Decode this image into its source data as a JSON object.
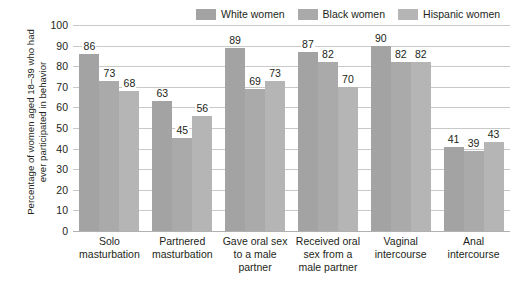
{
  "chart_data": {
    "type": "bar",
    "title": "",
    "xlabel": "",
    "ylabel": "Percentage of women aged 18–39 who had ever participated in behavior",
    "ylim": [
      0,
      100
    ],
    "ytick_values": [
      100,
      90,
      80,
      70,
      60,
      50,
      40,
      30,
      20,
      10,
      0
    ],
    "ytick_labels": [
      "100",
      "90",
      "80",
      "70",
      "60",
      "50",
      "40",
      "30",
      "20",
      "10",
      "0"
    ],
    "grid": true,
    "legend_position": "top-right",
    "categories": [
      "Solo masturbation",
      "Partnered masturbation",
      "Gave oral sex to a male partner",
      "Received oral sex from a male partner",
      "Vaginal intercourse",
      "Anal intercourse"
    ],
    "category_lines": [
      [
        "Solo",
        "masturbation"
      ],
      [
        "Partnered",
        "masturbation"
      ],
      [
        "Gave oral sex",
        "to a male",
        "partner"
      ],
      [
        "Received oral",
        "sex from a",
        "male partner"
      ],
      [
        "Vaginal",
        "intercourse"
      ],
      [
        "Anal",
        "intercourse"
      ]
    ],
    "series": [
      {
        "name": "White women",
        "color": "#a3a3a3",
        "values": [
          86,
          63,
          89,
          87,
          90,
          41
        ],
        "labels": [
          "86",
          "63",
          "89",
          "87",
          "90",
          "41"
        ]
      },
      {
        "name": "Black women",
        "color": "#aaaaaa",
        "values": [
          73,
          45,
          69,
          82,
          82,
          39
        ],
        "labels": [
          "73",
          "45",
          "69",
          "82",
          "82",
          "39"
        ]
      },
      {
        "name": "Hispanic women",
        "color": "#b5b5b5",
        "values": [
          68,
          56,
          73,
          70,
          82,
          43
        ],
        "labels": [
          "68",
          "56",
          "73",
          "70",
          "82",
          "43"
        ]
      }
    ]
  },
  "legend": {
    "items": [
      {
        "label": "White women",
        "color": "#a3a3a3"
      },
      {
        "label": "Black women",
        "color": "#aaaaaa"
      },
      {
        "label": "Hispanic women",
        "color": "#b5b5b5"
      }
    ]
  },
  "axis": {
    "y_title": "Percentage of women aged 18–39 who had ever participated in behavior"
  },
  "colors": {
    "text": "#231f20",
    "gridline": "#c9c9c9",
    "baseline": "#b0b0b0",
    "background": "#ffffff"
  }
}
